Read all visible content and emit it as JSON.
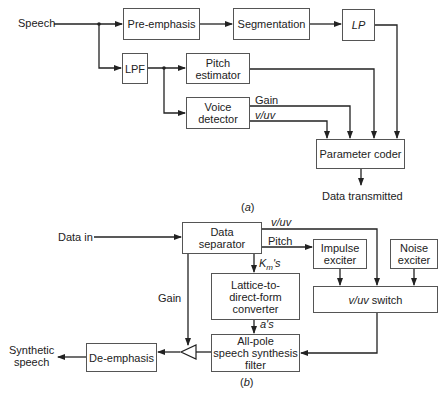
{
  "diagram_a": {
    "caption": "(a)",
    "input_label": "Speech",
    "blocks": {
      "pre_emphasis": "Pre-emphasis",
      "segmentation": "Segmentation",
      "lp": "LP",
      "lpf": "LPF",
      "pitch_estimator_l1": "Pitch",
      "pitch_estimator_l2": "estimator",
      "voice_detector_l1": "Voice",
      "voice_detector_l2": "detector",
      "parameter_coder": "Parameter coder"
    },
    "signals": {
      "gain": "Gain",
      "vuv": "v/uv"
    },
    "output_label": "Data transmitted"
  },
  "diagram_b": {
    "caption": "(b)",
    "input_label": "Data in",
    "blocks": {
      "data_separator_l1": "Data",
      "data_separator_l2": "separator",
      "impulse_exciter_l1": "Impulse",
      "impulse_exciter_l2": "exciter",
      "noise_exciter_l1": "Noise",
      "noise_exciter_l2": "exciter",
      "vuv_switch_italic": "v/uv",
      "vuv_switch_text": " switch",
      "lattice_l1": "Lattice-to-",
      "lattice_l2": "direct-form",
      "lattice_l3": "converter",
      "allpole_l1": "All-pole",
      "allpole_l2": "speech synthesis",
      "allpole_l3": "filter",
      "de_emphasis": "De-emphasis"
    },
    "signals": {
      "vuv": "v/uv",
      "pitch": "Pitch",
      "km_K": "K",
      "km_sub": "m",
      "km_suffix": "'s",
      "as": "a's",
      "gain": "Gain"
    },
    "output_label_l1": "Synthetic",
    "output_label_l2": "speech"
  }
}
